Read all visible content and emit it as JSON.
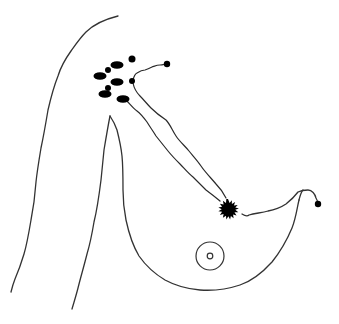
{
  "diagram": {
    "type": "anatomical-illustration",
    "colors": {
      "background": "#ffffff",
      "line": "#333333",
      "fill": "#000000"
    },
    "elements": {
      "body_outline": "torso-contour",
      "breast_outline": "breast-contour",
      "arm_outline": "arm-contour",
      "axillary_nodes": [
        {
          "cx": 132,
          "cy": 59,
          "rx": 3.5,
          "ry": 3.5
        },
        {
          "cx": 117,
          "cy": 65,
          "rx": 7,
          "ry": 4
        },
        {
          "cx": 108,
          "cy": 70,
          "rx": 3,
          "ry": 3
        },
        {
          "cx": 100,
          "cy": 76,
          "rx": 7,
          "ry": 4
        },
        {
          "cx": 117,
          "cy": 82,
          "rx": 7,
          "ry": 4
        },
        {
          "cx": 132,
          "cy": 81,
          "rx": 3,
          "ry": 3
        },
        {
          "cx": 108,
          "cy": 88,
          "rx": 3,
          "ry": 3
        },
        {
          "cx": 105,
          "cy": 94,
          "rx": 7,
          "ry": 4
        },
        {
          "cx": 123,
          "cy": 99,
          "rx": 7,
          "ry": 4
        }
      ],
      "peripheral_nodes": [
        {
          "cx": 167,
          "cy": 64,
          "r": 3.5
        },
        {
          "cx": 318,
          "cy": 204,
          "r": 3.5
        }
      ],
      "tumor": {
        "cx": 228,
        "cy": 209,
        "r": 9,
        "spikes": 16
      },
      "nipple_areola": {
        "cx": 210,
        "cy": 256,
        "outer_r": 14,
        "inner_r": 3
      }
    }
  }
}
